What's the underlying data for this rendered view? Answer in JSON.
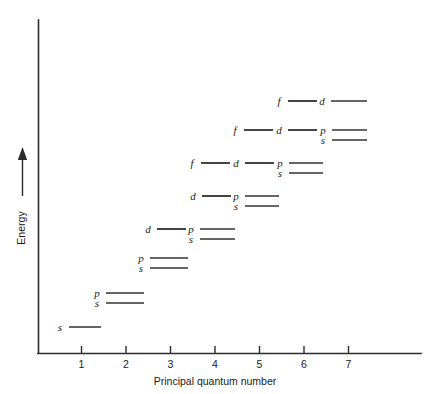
{
  "chart_data": {
    "type": "scatter",
    "title": "",
    "xlabel": "Principal quantum number",
    "ylabel": "Energy",
    "xticks": [
      "1",
      "2",
      "3",
      "4",
      "5",
      "6",
      "7"
    ],
    "xlim": [
      0,
      8
    ],
    "ylim": [
      0,
      1
    ],
    "grid": false,
    "legend": "none",
    "axis_colors": {
      "axis": "#2b2b2b",
      "level": "#333333",
      "background": "#ffffff"
    },
    "levels": [
      {
        "label": "s",
        "n": 1,
        "energy_row": 1,
        "label_x": 60,
        "line_x1": 69,
        "line_x2": 101,
        "y": 327
      },
      {
        "label": "p",
        "n": 2,
        "energy_row": 2,
        "label_x": 97,
        "line_x1": 106,
        "line_x2": 144,
        "y": 293
      },
      {
        "label": "s",
        "n": 2,
        "energy_row": 2,
        "label_x": 97,
        "line_x1": 106,
        "line_x2": 144,
        "y": 303
      },
      {
        "label": "p",
        "n": 3,
        "energy_row": 3,
        "label_x": 141,
        "line_x1": 150,
        "line_x2": 188,
        "y": 258
      },
      {
        "label": "s",
        "n": 3,
        "energy_row": 3,
        "label_x": 141,
        "line_x1": 150,
        "line_x2": 188,
        "y": 268
      },
      {
        "label": "d",
        "n": 3,
        "energy_row": 4,
        "label_x": 148,
        "line_x1": 157,
        "line_x2": 186,
        "y": 229
      },
      {
        "label": "p",
        "n": 4,
        "energy_row": 4,
        "label_x": 191,
        "line_x1": 200,
        "line_x2": 235,
        "y": 229
      },
      {
        "label": "s",
        "n": 4,
        "energy_row": 4,
        "label_x": 191,
        "line_x1": 200,
        "line_x2": 235,
        "y": 239
      },
      {
        "label": "d",
        "n": 4,
        "energy_row": 5,
        "label_x": 193,
        "line_x1": 202,
        "line_x2": 231,
        "y": 196
      },
      {
        "label": "p",
        "n": 5,
        "energy_row": 5,
        "label_x": 236,
        "line_x1": 245,
        "line_x2": 279,
        "y": 196
      },
      {
        "label": "s",
        "n": 5,
        "energy_row": 5,
        "label_x": 236,
        "line_x1": 245,
        "line_x2": 279,
        "y": 206
      },
      {
        "label": "f",
        "n": 4,
        "energy_row": 6,
        "label_x": 192,
        "line_x1": 201,
        "line_x2": 230,
        "y": 163
      },
      {
        "label": "d",
        "n": 5,
        "energy_row": 6,
        "label_x": 236,
        "line_x1": 245,
        "line_x2": 274,
        "y": 163
      },
      {
        "label": "p",
        "n": 6,
        "energy_row": 6,
        "label_x": 280,
        "line_x1": 289,
        "line_x2": 323,
        "y": 163
      },
      {
        "label": "s",
        "n": 6,
        "energy_row": 6,
        "label_x": 280,
        "line_x1": 289,
        "line_x2": 323,
        "y": 173
      },
      {
        "label": "f",
        "n": 5,
        "energy_row": 7,
        "label_x": 235,
        "line_x1": 244,
        "line_x2": 273,
        "y": 130
      },
      {
        "label": "d",
        "n": 6,
        "energy_row": 7,
        "label_x": 279,
        "line_x1": 288,
        "line_x2": 317,
        "y": 130
      },
      {
        "label": "p",
        "n": 7,
        "energy_row": 7,
        "label_x": 323,
        "line_x1": 332,
        "line_x2": 367,
        "y": 130
      },
      {
        "label": "s",
        "n": 7,
        "energy_row": 7,
        "label_x": 323,
        "line_x1": 332,
        "line_x2": 367,
        "y": 140
      },
      {
        "label": "f",
        "n": 6,
        "energy_row": 8,
        "label_x": 279,
        "line_x1": 288,
        "line_x2": 317,
        "y": 101
      },
      {
        "label": "d",
        "n": 7,
        "energy_row": 8,
        "label_x": 322,
        "line_x1": 331,
        "line_x2": 367,
        "y": 101
      }
    ],
    "connectors": [
      {
        "x1": 157,
        "x2": 186,
        "y": 229
      },
      {
        "x1": 202,
        "x2": 231,
        "y": 196
      },
      {
        "x1": 201,
        "x2": 230,
        "y": 163
      },
      {
        "x1": 245,
        "x2": 274,
        "y": 163
      },
      {
        "x1": 244,
        "x2": 273,
        "y": 130
      },
      {
        "x1": 288,
        "x2": 317,
        "y": 130
      },
      {
        "x1": 288,
        "x2": 317,
        "y": 101
      }
    ]
  },
  "axes": {
    "y_axis_label": "Energy",
    "x_axis_label": "Principal quantum number",
    "tick_labels": [
      "1",
      "2",
      "3",
      "4",
      "5",
      "6",
      "7"
    ]
  }
}
